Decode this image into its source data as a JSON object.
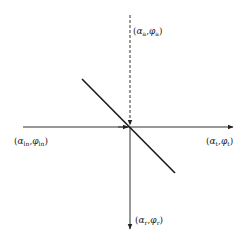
{
  "diagram": {
    "type": "coordinate-axes-with-line",
    "colors": {
      "axis": "#333333",
      "line": "#1a1a1a",
      "text": "#222222",
      "background": "#ffffff"
    },
    "origin": {
      "x": 130,
      "y": 127
    },
    "axes": {
      "top": {
        "style": "dashed",
        "from": [
          130,
          15
        ],
        "to": [
          130,
          127
        ],
        "arrow": "at-origin"
      },
      "horizontal": {
        "style": "solid",
        "from": [
          23,
          127
        ],
        "to": [
          233,
          127
        ],
        "arrow": "right"
      },
      "bottom": {
        "style": "solid",
        "from": [
          130,
          127
        ],
        "to": [
          130,
          229
        ],
        "arrow": "down"
      }
    },
    "diagonal_line": {
      "from": [
        82,
        79
      ],
      "to": [
        175,
        173
      ]
    },
    "labels": {
      "top": {
        "open": "(",
        "alpha": "α",
        "alpha_sub": "a",
        "sep": ",",
        "phi": "φ",
        "phi_sub": "a",
        "close": ")"
      },
      "left": {
        "open": "(",
        "alpha": "α",
        "alpha_sub": "ln",
        "sep": ",",
        "phi": "φ",
        "phi_sub": "ln",
        "close": ")"
      },
      "right": {
        "open": "(",
        "alpha": "α",
        "alpha_sub": "t",
        "sep": ",",
        "phi": "φ",
        "phi_sub": "t",
        "close": ")"
      },
      "bottom": {
        "open": "(",
        "alpha": "α",
        "alpha_sub": "r",
        "sep": ",",
        "phi": "φ",
        "phi_sub": "r",
        "close": ")"
      }
    }
  }
}
